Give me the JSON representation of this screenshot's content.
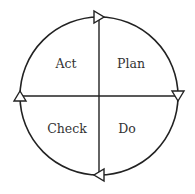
{
  "diagram": {
    "quadrants": [
      {
        "id": "act",
        "label": "Act",
        "x": 66,
        "y": 63
      },
      {
        "id": "plan",
        "label": "Plan",
        "x": 131,
        "y": 63
      },
      {
        "id": "check",
        "label": "Check",
        "x": 67,
        "y": 128
      },
      {
        "id": "do",
        "label": "Do",
        "x": 127,
        "y": 128
      }
    ],
    "arrows": [
      {
        "position": "top",
        "direction": "right"
      },
      {
        "position": "right",
        "direction": "down"
      },
      {
        "position": "bottom",
        "direction": "left"
      },
      {
        "position": "left",
        "direction": "up"
      }
    ],
    "colors": {
      "stroke": "#222222",
      "text": "#333333"
    }
  }
}
